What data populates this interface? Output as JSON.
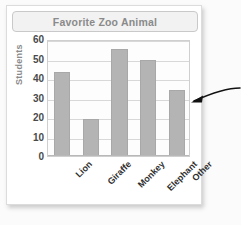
{
  "chart_data": {
    "type": "bar",
    "title": "Favorite Zoo Animal",
    "xlabel": "",
    "ylabel": "Students",
    "categories": [
      "Lion",
      "Giraffe",
      "Monkey",
      "Elephant",
      "Other"
    ],
    "values": [
      43,
      19,
      55,
      49,
      34
    ],
    "ylim": [
      0,
      60
    ],
    "yticks": [
      0,
      10,
      20,
      30,
      40,
      50,
      60
    ],
    "ytick_labels": [
      "0",
      "10",
      "20",
      "30",
      "40",
      "50",
      "60"
    ],
    "grid": true,
    "legend": null,
    "bar_color": "#b4b4b4",
    "title_color": "#8a8a8a",
    "axis_label_color": "#8a8a8a",
    "annotations": [
      {
        "name": "pointer-arrow",
        "text": "",
        "points_to_category": "Other",
        "color": "#111111"
      }
    ]
  }
}
